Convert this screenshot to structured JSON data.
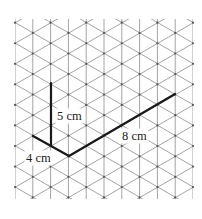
{
  "diagram": {
    "type": "isometric-grid",
    "grid": {
      "x_start": 15,
      "x_end": 193,
      "y_start": 19,
      "y_end": 199,
      "columns": 11,
      "line_color": "#9a9a9a",
      "node_color": "#555555"
    },
    "edges": [
      {
        "name": "height-edge",
        "from": [
          51,
          83
        ],
        "to": [
          51,
          146
        ],
        "label": "5 cm",
        "label_pos": [
          57,
          120
        ]
      },
      {
        "name": "width-edge",
        "from": [
          33,
          136
        ],
        "to": [
          69,
          156
        ],
        "label": "4 cm",
        "label_pos": [
          26,
          162
        ]
      },
      {
        "name": "length-edge",
        "from": [
          69,
          156
        ],
        "to": [
          175,
          94
        ],
        "label": "8 cm",
        "label_pos": [
          122,
          140
        ]
      }
    ],
    "edge_color": "#1a1a1a",
    "labels": {
      "height": "5 cm",
      "width": "4 cm",
      "length": "8 cm"
    }
  }
}
